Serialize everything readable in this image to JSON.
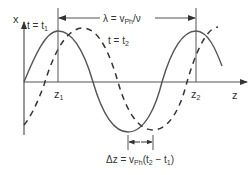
{
  "diagram": {
    "type": "wave-propagation",
    "colors": {
      "ink": "#444444",
      "text": "#333333",
      "background": "#ffffff"
    },
    "axes": {
      "y_label": "x",
      "x_label": "z"
    },
    "curves": [
      {
        "name": "t = t1",
        "style": "solid",
        "label_main": "t = t",
        "label_sub": "1"
      },
      {
        "name": "t = t2",
        "style": "dashed",
        "label_main": "t = t",
        "label_sub": "2"
      }
    ],
    "markers": {
      "z1": {
        "main": "z",
        "sub": "1"
      },
      "z2": {
        "main": "z",
        "sub": "2"
      }
    },
    "wavelength": {
      "prefix": "λ = v",
      "sub": "Ph",
      "suffix": "/ν"
    },
    "shift": {
      "prefix": "Δz = v",
      "sub": "Ph",
      "mid": "(t",
      "sub2": "2",
      "mid2": " − t",
      "sub3": "1",
      "suffix": ")"
    }
  }
}
